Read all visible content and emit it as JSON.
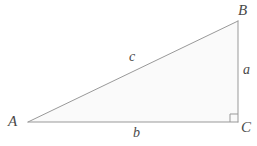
{
  "diagram": {
    "kind": "right-triangle",
    "background_color": "#ffffff",
    "stroke_color": "#999999",
    "fill_color": "#fafafa",
    "label_color": "#4a4a4a",
    "stroke_width": 1,
    "width": 257,
    "height": 146,
    "vertices": [
      {
        "name": "A",
        "label": "A",
        "x": 28,
        "y": 122,
        "angle": "acute"
      },
      {
        "name": "B",
        "label": "B",
        "x": 238,
        "y": 21,
        "angle": "acute"
      },
      {
        "name": "C",
        "label": "C",
        "x": 238,
        "y": 122,
        "angle": "right"
      }
    ],
    "sides": [
      {
        "name": "a",
        "label": "a",
        "from": "B",
        "to": "C",
        "role": "opposite-leg",
        "orientation": "vertical"
      },
      {
        "name": "b",
        "label": "b",
        "from": "A",
        "to": "C",
        "role": "adjacent-leg",
        "orientation": "horizontal"
      },
      {
        "name": "c",
        "label": "c",
        "from": "A",
        "to": "B",
        "role": "hypotenuse",
        "orientation": "diagonal"
      }
    ],
    "right_angle_marker": {
      "at_vertex": "C",
      "size": 8,
      "label": "right-angle-marker"
    }
  }
}
